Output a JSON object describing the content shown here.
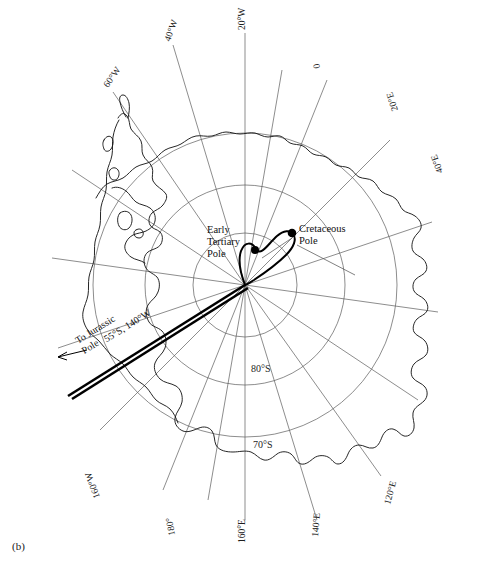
{
  "figure": {
    "panel_label": "(b)",
    "projection": "polar stereographic, south polar",
    "center_point_label": "South Pole"
  },
  "longitude_labels": [
    {
      "name": "lon-20W",
      "text": "20°W",
      "angle_deg": 20,
      "dir": "W"
    },
    {
      "name": "lon-40W",
      "text": "40°W",
      "angle_deg": 40,
      "dir": "W"
    },
    {
      "name": "lon-60W",
      "text": "60°W",
      "angle_deg": 60,
      "dir": "W"
    },
    {
      "name": "lon-0",
      "text": "0",
      "angle_deg": 0,
      "dir": "0"
    },
    {
      "name": "lon-20E",
      "text": "20°E",
      "angle_deg": 20,
      "dir": "E"
    },
    {
      "name": "lon-40E",
      "text": "40°E",
      "angle_deg": 40,
      "dir": "E"
    },
    {
      "name": "lon-120E",
      "text": "120°E",
      "angle_deg": 120,
      "dir": "E"
    },
    {
      "name": "lon-140E",
      "text": "140°E",
      "angle_deg": 140,
      "dir": "E"
    },
    {
      "name": "lon-160E",
      "text": "160°E",
      "angle_deg": 160,
      "dir": "E"
    },
    {
      "name": "lon-180",
      "text": "180°",
      "angle_deg": 180,
      "dir": "0"
    },
    {
      "name": "lon-160W",
      "text": "160°W",
      "angle_deg": 160,
      "dir": "W"
    }
  ],
  "latitude_labels": [
    {
      "name": "lat-80S",
      "text": "80°S",
      "value": -80
    },
    {
      "name": "lat-70S",
      "text": "70°S",
      "value": -70
    }
  ],
  "poles": [
    {
      "name": "cretaceous-pole",
      "label_line1": "Cretaceous",
      "label_line2": "Pole"
    },
    {
      "name": "early-tertiary-pole",
      "label_line1": "Early",
      "label_line2": "Tertiary",
      "label_line3": "Pole"
    }
  ],
  "jurassic_annotation": {
    "line1": "To Jurassic",
    "line2": "Pole",
    "line3": "55°S, 140°W",
    "arrow": "left-arrow"
  },
  "colors": {
    "background": "#ffffff",
    "coastline": "#1a1a1a",
    "graticule": "#5b5b5b",
    "apw_path": "#000000",
    "text": "#111111"
  }
}
